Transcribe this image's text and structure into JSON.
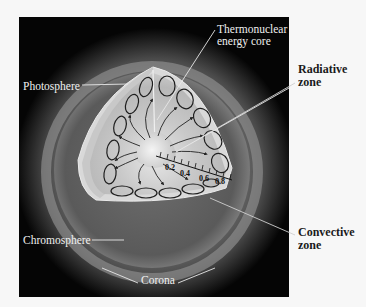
{
  "figure": {
    "labels": {
      "core": [
        "Thermonuclear",
        "energy core"
      ],
      "photosphere": "Photosphere",
      "radiative": [
        "Radiative",
        "zone"
      ],
      "convective": [
        "Convective",
        "zone"
      ],
      "chromosphere": "Chromosphere",
      "corona": "Corona"
    },
    "scale": {
      "ticks": [
        "0.2",
        "0.4",
        "0.6",
        "0.8"
      ]
    },
    "colors": {
      "background": "#f7f7f7",
      "panel": "#050505",
      "label_on_dark": "#f0f0f0",
      "label_on_light": "#1a1a1a"
    }
  }
}
